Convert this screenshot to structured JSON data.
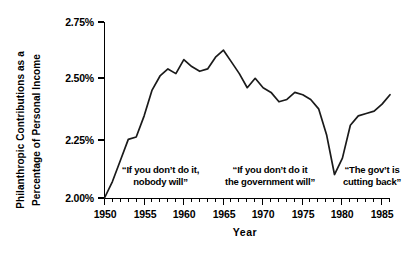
{
  "chart_data": {
    "type": "line",
    "title": "",
    "xlabel": "Year",
    "ylabel": "Philanthropic Contributions as a Percentage of Personal Income",
    "ylabel_lines": [
      "Philanthropic Contributions as a",
      "Percentage of Personal Income"
    ],
    "xlim": [
      1950,
      1986
    ],
    "ylim": [
      2.0,
      2.75
    ],
    "grid": false,
    "legend": "none",
    "y_tick_labels": [
      "2.75%",
      "2.50%",
      "2.25%",
      "2.00%"
    ],
    "y_tick_values": [
      2.75,
      2.5,
      2.25,
      2.0
    ],
    "x_tick_labels": [
      "1950",
      "1955",
      "1960",
      "1965",
      "1970",
      "1975",
      "1980",
      "1985"
    ],
    "x_tick_values": [
      1950,
      1955,
      1960,
      1965,
      1970,
      1975,
      1980,
      1985
    ],
    "x_minor_tick_interval": 1,
    "series": [
      {
        "name": "Philanthropic contributions",
        "x": [
          1950,
          1951,
          1952,
          1953,
          1954,
          1955,
          1956,
          1957,
          1958,
          1959,
          1960,
          1961,
          1962,
          1963,
          1964,
          1965,
          1966,
          1967,
          1968,
          1969,
          1970,
          1971,
          1972,
          1973,
          1974,
          1975,
          1976,
          1977,
          1978,
          1979,
          1980,
          1981,
          1982,
          1983,
          1984,
          1985,
          1986
        ],
        "values": [
          2.0,
          2.07,
          2.16,
          2.25,
          2.26,
          2.35,
          2.46,
          2.52,
          2.55,
          2.53,
          2.59,
          2.56,
          2.54,
          2.55,
          2.6,
          2.63,
          2.58,
          2.53,
          2.47,
          2.51,
          2.47,
          2.45,
          2.41,
          2.42,
          2.45,
          2.44,
          2.42,
          2.38,
          2.27,
          2.1,
          2.17,
          2.31,
          2.35,
          2.36,
          2.37,
          2.4,
          2.44
        ]
      }
    ],
    "annotations": [
      {
        "id": "annotation-1950s",
        "lines": [
          "“If you don’t do it,",
          "nobody will”"
        ],
        "era": "1950s"
      },
      {
        "id": "annotation-1960s",
        "lines": [
          "“If you don’t do it",
          "the government will”"
        ],
        "era": "1960s-1970s"
      },
      {
        "id": "annotation-1980s",
        "lines": [
          "“The gov’t is",
          "cutting back”"
        ],
        "era": "1980s"
      }
    ],
    "colors": {
      "line": "#1a1a1a",
      "axis": "#000000",
      "background": "#ffffff"
    }
  }
}
